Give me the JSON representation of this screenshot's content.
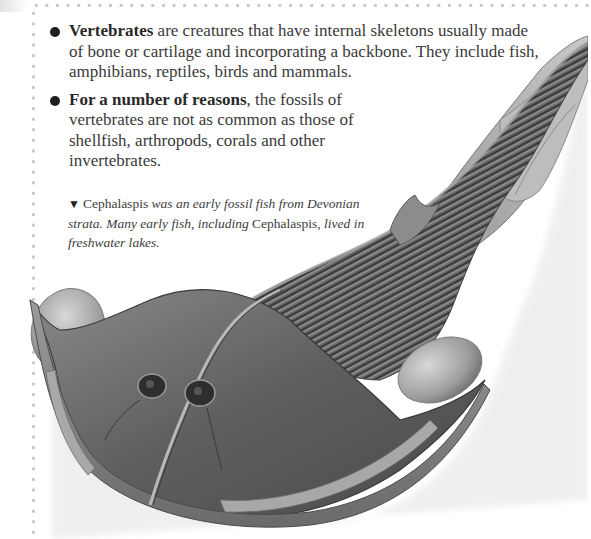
{
  "page": {
    "bullets": [
      {
        "bold": "Vertebrates",
        "text": " are creatures that have internal skeletons usually made of bone or cartilage and incorporating a backbone. They include fish, amphibians, reptiles, birds and mammals."
      },
      {
        "bold": "For a number of reasons",
        "text": ", the fossils of vertebrates are not as common as those of shellfish, arthropods, corals and other invertebrates."
      }
    ],
    "caption": {
      "marker": "▼",
      "part1_roman": "Cephalaspis",
      "part2_italic": " was an early fossil fish from Devonian strata. Many early fish, including ",
      "part3_roman": "Cephalaspis,",
      "part4_italic": " lived in freshwater lakes."
    },
    "illustration": {
      "subject": "Cephalaspis fossil fish",
      "icon": "fish-illustration"
    },
    "colors": {
      "text": "#3a3a3a",
      "bullet": "#1e1e1e",
      "dots": "#c9c9c9",
      "background": "#ffffff"
    }
  }
}
